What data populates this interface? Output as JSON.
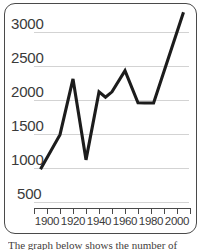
{
  "chart_data": {
    "type": "line",
    "title": "",
    "xlabel": "",
    "ylabel": "",
    "xlim": [
      1890,
      2010
    ],
    "ylim": [
      430,
      3330
    ],
    "grid": true,
    "legend": null,
    "line_color": "#1c1c1c",
    "grid_color": "#d3d3d3",
    "axis_color": "#4a4a4a",
    "ytick_labels": [
      "3000",
      "2500",
      "2000",
      "1500",
      "1000",
      "500"
    ],
    "ytick_values": [
      3000,
      2500,
      2000,
      1500,
      1000,
      500
    ],
    "xtick_values": [
      1890,
      1900,
      1910,
      1920,
      1930,
      1940,
      1950,
      1960,
      1970,
      1980,
      1990,
      2000,
      2010
    ],
    "xtick_labels": [
      "",
      "1900",
      "",
      "1920",
      "",
      "1940",
      "",
      "1960",
      "",
      "1980",
      "",
      "2000",
      ""
    ],
    "x": [
      1895,
      1910,
      1920,
      1930,
      1940,
      1945,
      1950,
      1960,
      1970,
      1975,
      1982,
      2005
    ],
    "values": [
      980,
      1490,
      2310,
      1120,
      2120,
      2040,
      2120,
      2430,
      1960,
      1955,
      1955,
      3290
    ],
    "series": [
      {
        "name": "series-1",
        "x": [
          1895,
          1910,
          1920,
          1930,
          1940,
          1945,
          1950,
          1960,
          1970,
          1975,
          1982,
          2005
        ],
        "values": [
          980,
          1490,
          2310,
          1120,
          2120,
          2040,
          2120,
          2430,
          1960,
          1955,
          1955,
          3290
        ]
      }
    ]
  },
  "caption": {
    "text": "The graph below shows the number of"
  }
}
